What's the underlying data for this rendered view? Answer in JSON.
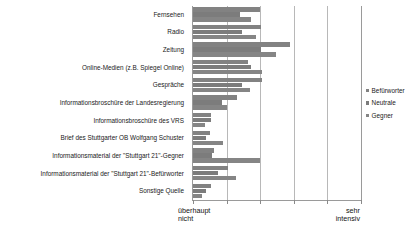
{
  "chart_data": {
    "type": "bar",
    "orientation": "horizontal",
    "title": "",
    "xlabel": "",
    "ylabel": "",
    "grid": true,
    "legend_position": "right",
    "xlim": [
      0,
      5
    ],
    "x_axis_left_caption": "überhaupt\nnicht",
    "x_axis_right_caption": "sehr\nintensiv",
    "tick_values": [
      0,
      1,
      2,
      3,
      4,
      5
    ],
    "categories": [
      "Fernsehen",
      "Radio",
      "Zeitung",
      "Online-Medien (z.B. Spiegel Online)",
      "Gespräche",
      "Informationsbroschüre der Landesregierung",
      "Informationsbroschüre des VRS",
      "Brief des Stuttgarter OB Wolfgang Schuster",
      "Informationsmaterial der \"Stuttgart 21\"-Gegner",
      "Informationsmaterial der \"Stuttgart 21\"-Befürworter",
      "Sonstige Quelle"
    ],
    "series": [
      {
        "name": "Befürworter",
        "color": "#828282",
        "values": [
          2.0,
          2.03,
          2.88,
          1.65,
          2.05,
          1.3,
          0.55,
          0.5,
          0.63,
          1.05,
          0.53
        ]
      },
      {
        "name": "Neutrale",
        "color": "#7c7c7c",
        "values": [
          1.4,
          1.45,
          2.03,
          1.73,
          1.45,
          0.87,
          0.53,
          0.4,
          0.58,
          0.75,
          0.4
        ]
      },
      {
        "name": "Gegner",
        "color": "#858585",
        "values": [
          1.72,
          1.88,
          2.48,
          2.05,
          1.7,
          1.02,
          0.35,
          0.9,
          2.0,
          1.27,
          0.28
        ]
      }
    ]
  },
  "legend": {
    "items": [
      {
        "label": "Befürworter"
      },
      {
        "label": "Neutrale"
      },
      {
        "label": "Gegner"
      }
    ]
  }
}
